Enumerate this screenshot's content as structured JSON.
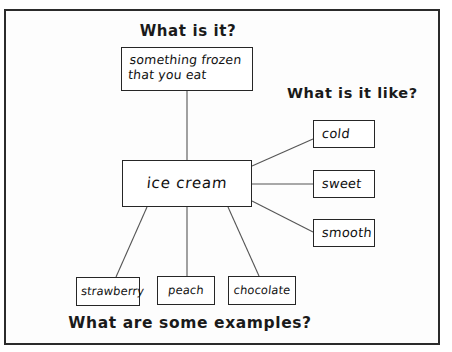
{
  "worksheet": {
    "type": "concept-definition-map",
    "headings": {
      "top": "What is it?",
      "right": "What is it like?",
      "bottom": "What are some examples?"
    },
    "definition": {
      "line1": "something frozen",
      "line2": "that you  eat",
      "text": "something frozen that you eat"
    },
    "topic": "ice cream",
    "attributes": [
      {
        "label": "cold"
      },
      {
        "label": "sweet"
      },
      {
        "label": "smooth"
      }
    ],
    "examples": [
      {
        "label": "strawberry"
      },
      {
        "label": "peach"
      },
      {
        "label": "chocolate"
      }
    ],
    "colors": {
      "ink": "#111111",
      "box_border": "#262626",
      "connector": "#555555",
      "page_border": "#2b2b2b",
      "page_background": "#ffffff"
    }
  }
}
